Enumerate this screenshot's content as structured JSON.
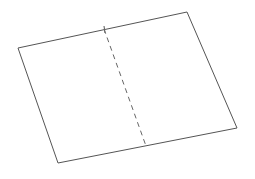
{
  "canvas": {
    "width": 255,
    "height": 179,
    "background_color": "#ffffff"
  },
  "figure": {
    "name": "folded-sheet-quadrilateral",
    "sheet": {
      "fill_color": "#ffffff",
      "stroke_color": "#555555",
      "stroke_width": 1,
      "points": "18,48 187,12 237,128 58,163",
      "vertices": [
        {
          "label": "left",
          "x": 18,
          "y": 48
        },
        {
          "label": "top-right",
          "x": 187,
          "y": 12
        },
        {
          "label": "bottom-right",
          "x": 237,
          "y": 128
        },
        {
          "label": "bottom-left",
          "x": 58,
          "y": 163
        }
      ]
    },
    "fold_line": {
      "stroke_color": "#666666",
      "stroke_width": 1,
      "dash_pattern": "5,4",
      "x1": 104,
      "y1": 29,
      "x2": 146,
      "y2": 146
    },
    "fold_tick": {
      "stroke_color": "#555555",
      "stroke_width": 1,
      "x1": 104,
      "y1": 26,
      "x2": 105,
      "y2": 33
    }
  }
}
